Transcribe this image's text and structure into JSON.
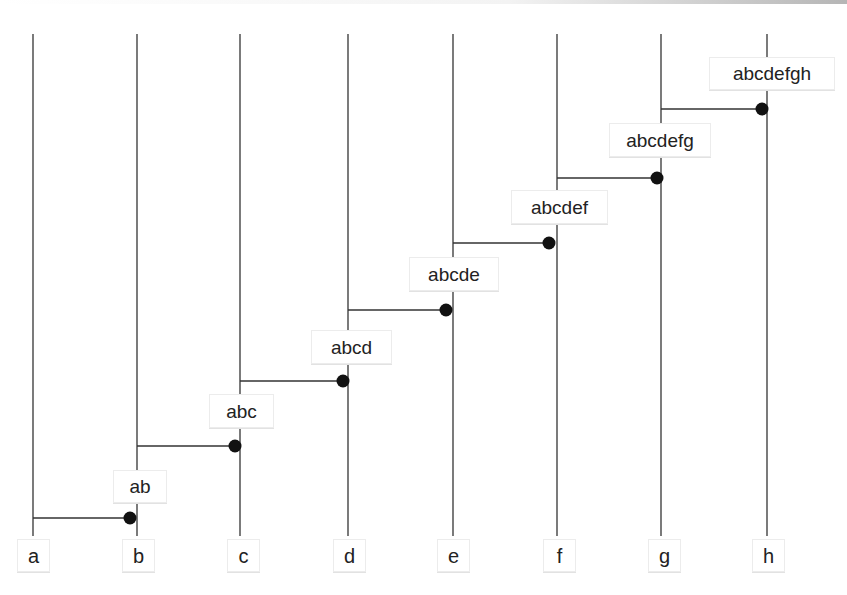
{
  "diagram": {
    "type": "staircase-merge-diagram",
    "line_color": "#333333",
    "dot_color": "#111111",
    "lines": [
      {
        "id": "a",
        "label": "a",
        "x": 33
      },
      {
        "id": "b",
        "label": "b",
        "x": 137
      },
      {
        "id": "c",
        "label": "c",
        "x": 240
      },
      {
        "id": "d",
        "label": "d",
        "x": 348
      },
      {
        "id": "e",
        "label": "e",
        "x": 453
      },
      {
        "id": "f",
        "label": "f",
        "x": 557
      },
      {
        "id": "g",
        "label": "g",
        "x": 661
      },
      {
        "id": "h",
        "label": "h",
        "x": 767
      }
    ],
    "merges": [
      {
        "from": "a",
        "to": "b",
        "y": 518,
        "label": "ab"
      },
      {
        "from": "b",
        "to": "c",
        "y": 446,
        "label": "abc"
      },
      {
        "from": "c",
        "to": "d",
        "y": 381,
        "label": "abcd"
      },
      {
        "from": "d",
        "to": "e",
        "y": 310,
        "label": "abcde"
      },
      {
        "from": "e",
        "to": "f",
        "y": 243,
        "label": "abcdef"
      },
      {
        "from": "f",
        "to": "g",
        "y": 178,
        "label": "abcdefg"
      },
      {
        "from": "g",
        "to": "h",
        "y": 109,
        "label": "abcdefgh"
      }
    ]
  }
}
